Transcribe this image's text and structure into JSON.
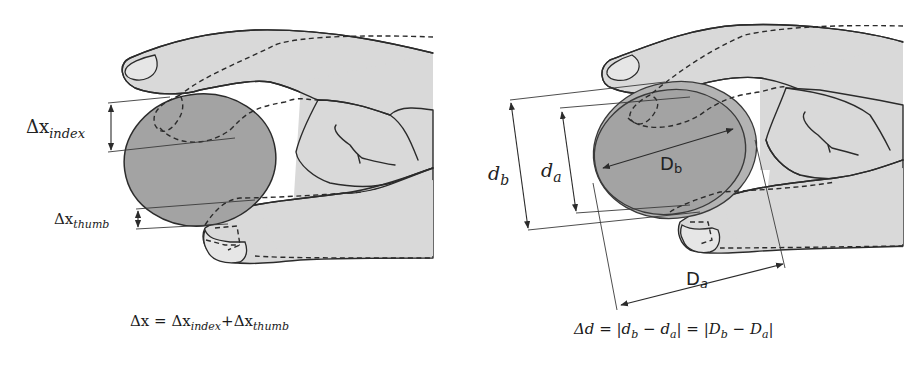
{
  "left_panel": {
    "labels": {
      "delta_x_index": {
        "main": "Δx",
        "sub": "index"
      },
      "delta_x_thumb": {
        "main": "Δx",
        "sub": "thumb"
      }
    },
    "formula": {
      "lhs": "Δx",
      "eq": " = ",
      "term1_main": "Δx",
      "term1_sub": "index",
      "plus": "+",
      "term2_main": "Δx",
      "term2_sub": "thumb"
    }
  },
  "right_panel": {
    "labels": {
      "d_b": {
        "main": "d",
        "sub": "b"
      },
      "d_a": {
        "main": "d",
        "sub": "a"
      },
      "D_b": {
        "main": "D",
        "sub": "b"
      },
      "D_a": {
        "main": "D",
        "sub": "a"
      }
    },
    "formula": {
      "lhs": "Δd",
      "eq1": " = |",
      "t1_main": "d",
      "t1_sub": "b",
      "minus1": " − ",
      "t2_main": "d",
      "t2_sub": "a",
      "eq2": "| = |",
      "t3_main": "D",
      "t3_sub": "b",
      "minus2": " − ",
      "t4_main": "D",
      "t4_sub": "a",
      "close": "|"
    }
  },
  "colors": {
    "skin": "#d9d9d9",
    "ball": "#a3a3a3",
    "ball_outer": "#b3b3b3",
    "stroke": "#2b2b2b",
    "background": "#ffffff"
  }
}
